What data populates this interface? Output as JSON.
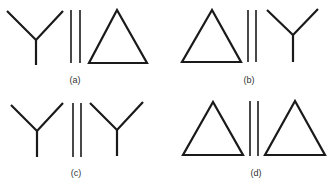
{
  "figure": {
    "panels": [
      {
        "id": "a",
        "label": "(a)",
        "left": "Y-junction",
        "relation": "parallel-lines",
        "right": "triangle"
      },
      {
        "id": "b",
        "label": "(b)",
        "left": "triangle",
        "relation": "parallel-lines",
        "right": "Y-junction"
      },
      {
        "id": "c",
        "label": "(c)",
        "left": "Y-junction",
        "relation": "parallel-lines",
        "right": "Y-junction"
      },
      {
        "id": "d",
        "label": "(d)",
        "left": "triangle",
        "relation": "parallel-lines",
        "right": "triangle"
      }
    ]
  },
  "colors": {
    "stroke": "#1a1a1a",
    "label": "#333333",
    "background": "#ffffff"
  }
}
